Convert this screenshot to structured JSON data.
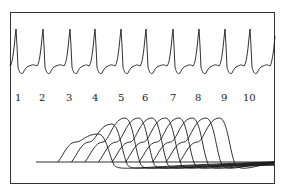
{
  "figure": {
    "beat_labels": [
      "1",
      "2",
      "3",
      "4",
      "5",
      "6",
      "7",
      "8",
      "9",
      "10"
    ],
    "colors": {
      "trace": "#1a1a1a",
      "frame": "#333333",
      "background": "#ffffff"
    }
  },
  "chart_data": [
    {
      "type": "line",
      "title": "",
      "description": "ECG-like periodic trace with 10 numbered beats",
      "x": [
        "1",
        "2",
        "3",
        "4",
        "5",
        "6",
        "7",
        "8",
        "9",
        "10"
      ],
      "series": [
        {
          "name": "ecg",
          "beat_count": 10
        }
      ],
      "grid": false
    },
    {
      "type": "line",
      "title": "",
      "description": "Overlay of 10 bell-shaped waveforms shifted progressively to the right on a common baseline",
      "series_count": 10,
      "grid": false
    }
  ]
}
